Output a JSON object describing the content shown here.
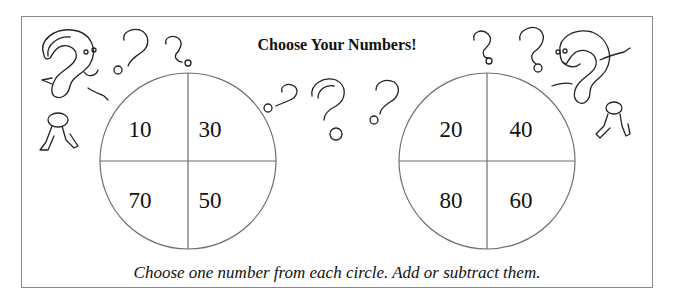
{
  "title": "Choose Your Numbers!",
  "instructions": "Choose one number from each circle. Add or subtract them.",
  "circles": [
    {
      "name": "left",
      "numbers": {
        "top_left": "10",
        "top_right": "30",
        "bottom_left": "70",
        "bottom_right": "50"
      }
    },
    {
      "name": "right",
      "numbers": {
        "top_left": "20",
        "top_right": "40",
        "bottom_left": "80",
        "bottom_right": "60"
      }
    }
  ],
  "decorations": [
    "question-mark-character-left",
    "question-mark-character-right",
    "question-mark-doodles"
  ]
}
